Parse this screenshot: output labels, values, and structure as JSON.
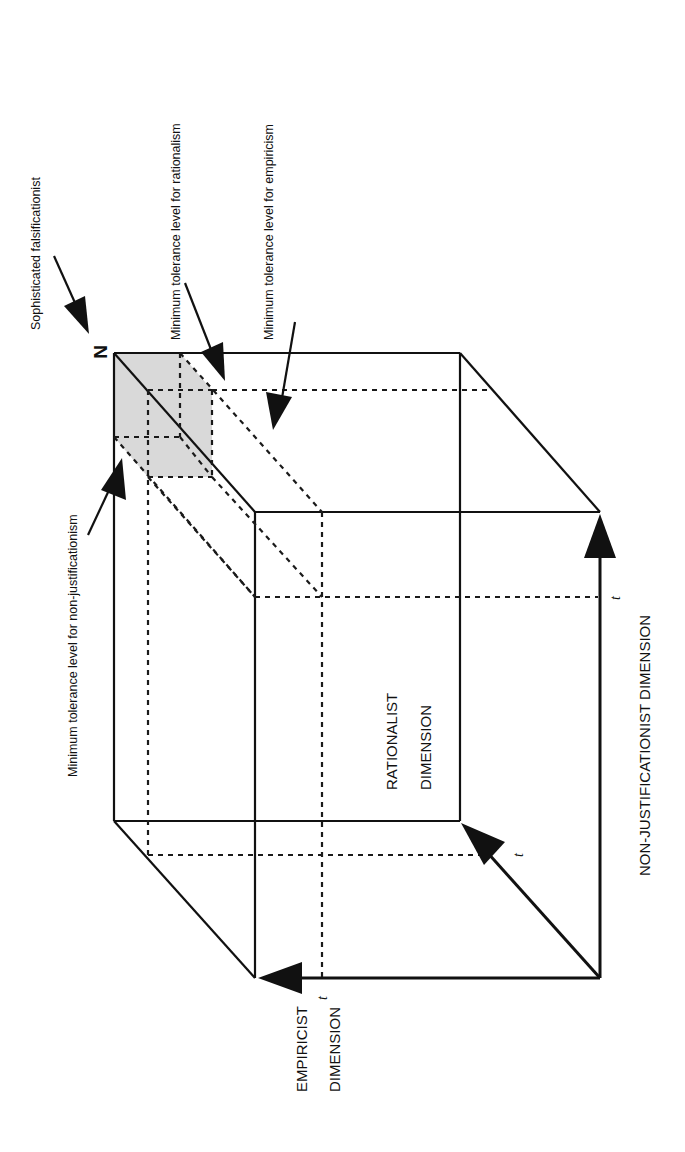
{
  "figure": {
    "orientation": "rotated 90 degrees counter-clockwise",
    "corner_label": "N",
    "annotations": {
      "sophisticated": "Sophisticated falsificationist",
      "rationalism": "Minimum tolerance level for rationalism",
      "empiricism": "Minimum tolerance level for empiricism",
      "non_justificationism": "Minimum tolerance level for non-justificationism"
    },
    "axes": {
      "empiricist_line1": "EMPIRICIST",
      "empiricist_line2": "DIMENSION",
      "rationalist_line1": "RATIONALIST",
      "rationalist_line2": "DIMENSION",
      "non_justificationist": "NON-JUSTIFICATIONIST DIMENSION"
    },
    "threshold_marks": {
      "empiricist_t": "t",
      "rationalist_t": "t",
      "non_justificationist_t": "t"
    },
    "colors": {
      "line": "#111111",
      "shaded_region": "#d9d9d9",
      "background": "#ffffff"
    }
  }
}
